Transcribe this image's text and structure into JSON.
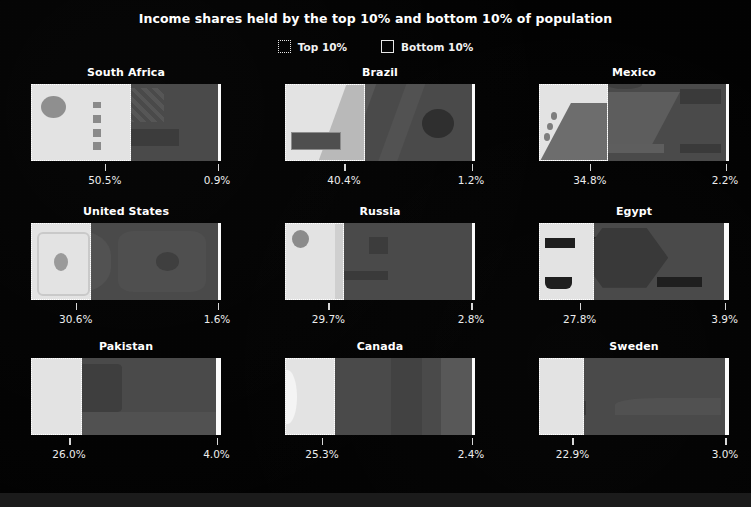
{
  "title": "Income shares held by the top 10% and bottom 10% of population",
  "legend": [
    {
      "label": "Top 10%",
      "swatch": "dotted-square-icon"
    },
    {
      "label": "Bottom 10%",
      "swatch": "outline-square-icon"
    }
  ],
  "chart_data": {
    "type": "bar",
    "title": "Income shares held by the top 10% and bottom 10% of population",
    "xlabel": "",
    "ylabel": "",
    "grid": false,
    "legend_position": "top-center",
    "series": [
      {
        "name": "Top 10%",
        "values": [
          50.5,
          40.4,
          34.8,
          30.6,
          29.7,
          27.8,
          26.0,
          25.3,
          22.9
        ]
      },
      {
        "name": "Bottom 10%",
        "values": [
          0.9,
          1.2,
          2.2,
          1.6,
          2.8,
          3.9,
          4.0,
          2.4,
          3.0
        ]
      }
    ],
    "categories": [
      "South Africa",
      "Brazil",
      "Mexico",
      "United States",
      "Russia",
      "Egypt",
      "Pakistan",
      "Canada",
      "Sweden"
    ],
    "panels": [
      {
        "country": "South Africa",
        "top": 50.5,
        "bottom": 0.9,
        "top_label": "50.5%",
        "bottom_label": "0.9%"
      },
      {
        "country": "Brazil",
        "top": 40.4,
        "bottom": 1.2,
        "top_label": "40.4%",
        "bottom_label": "1.2%"
      },
      {
        "country": "Mexico",
        "top": 34.8,
        "bottom": 2.2,
        "top_label": "34.8%",
        "bottom_label": "2.2%"
      },
      {
        "country": "United States",
        "top": 30.6,
        "bottom": 1.6,
        "top_label": "30.6%",
        "bottom_label": "1.6%"
      },
      {
        "country": "Russia",
        "top": 29.7,
        "bottom": 2.8,
        "top_label": "29.7%",
        "bottom_label": "2.8%"
      },
      {
        "country": "Egypt",
        "top": 27.8,
        "bottom": 3.9,
        "top_label": "27.8%",
        "bottom_label": "3.9%"
      },
      {
        "country": "Pakistan",
        "top": 26.0,
        "bottom": 4.0,
        "top_label": "26.0%",
        "bottom_label": "4.0%"
      },
      {
        "country": "Canada",
        "top": 25.3,
        "bottom": 2.4,
        "top_label": "25.3%",
        "bottom_label": "2.4%"
      },
      {
        "country": "Sweden",
        "top": 22.9,
        "bottom": 3.0,
        "top_label": "22.9%",
        "bottom_label": "3.0%"
      }
    ]
  },
  "colors": {
    "background": "#020202",
    "top_block": "#e3e3e3",
    "bottom_bar": "#fbfbfb",
    "field": "#4a4a4a",
    "text": "#ffffff"
  }
}
